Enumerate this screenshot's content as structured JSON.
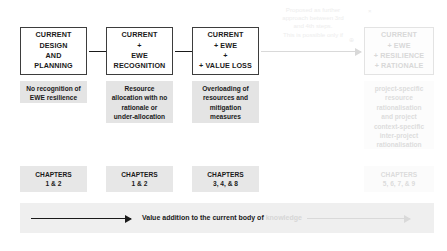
{
  "diagram": {
    "steps": [
      {
        "id": "step-1",
        "lines": [
          "CURRENT",
          "DESIGN",
          "AND",
          "PLANNING"
        ],
        "faded": false
      },
      {
        "id": "step-2",
        "lines": [
          "CURRENT",
          "+",
          "EWE",
          "RECOGNITION"
        ],
        "faded": false
      },
      {
        "id": "step-3",
        "lines": [
          "CURRENT",
          "+ EWE",
          "+",
          "+ VALUE LOSS"
        ],
        "faded": false
      },
      {
        "id": "step-4",
        "lines": [
          "CURRENT",
          "+ EWE",
          "+ RESILIENCE",
          "+ RATIONALE"
        ],
        "faded": true
      }
    ],
    "descriptions": [
      {
        "id": "desc-1",
        "lines": [
          "No recognition of",
          "EWE resilience"
        ],
        "faded": false
      },
      {
        "id": "desc-2",
        "lines": [
          "Resource",
          "allocation with no",
          "rationale or",
          "under-allocation"
        ],
        "faded": false
      },
      {
        "id": "desc-3",
        "lines": [
          "Overloading of",
          "resources and",
          "mitigation",
          "measures"
        ],
        "faded": false
      },
      {
        "id": "desc-4",
        "lines": [
          "project-specific",
          "resource",
          "rationalisation",
          "and project",
          "context-specific",
          "inter-project",
          "rationalisation"
        ],
        "faded": true
      }
    ],
    "chapters": [
      {
        "id": "chapters-1",
        "lines": [
          "CHAPTERS",
          "1 & 2"
        ],
        "faded": false
      },
      {
        "id": "chapters-2",
        "lines": [
          "CHAPTERS",
          "1 & 2"
        ],
        "faded": false
      },
      {
        "id": "chapters-3",
        "lines": [
          "CHAPTERS",
          "3, 4, & 8"
        ],
        "faded": false
      },
      {
        "id": "chapters-4",
        "lines": [
          "CHAPTERS",
          "5, 6, 7, & 9"
        ],
        "faded": true
      }
    ],
    "annotation": {
      "lines": [
        "Proposed as further",
        "approach between 3rd",
        "and 4th steps.",
        "This is possible only if"
      ],
      "marker": "⊕",
      "corner_marker": "×"
    },
    "bottom_band": {
      "label_solid": "Value addition to the current body of",
      "label_faded": "knowledge"
    },
    "colors": {
      "box_border": "#3d3d3d",
      "description_fill": "#e4e4e4",
      "chapter_fill": "#e7e7e7",
      "band_fill": "#efefef",
      "text": "#1a1a1a",
      "faded_text": "#d8d8d8",
      "arrow": "#1a1a1a",
      "faded_arrow": "#d9d9d9"
    }
  }
}
